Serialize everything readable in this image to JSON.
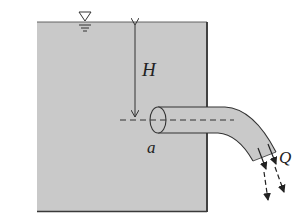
{
  "figure": {
    "labels": {
      "head": "H",
      "pipe_area": "a",
      "discharge": "Q"
    },
    "symbols": {
      "free_surface": "free-surface-triangle"
    },
    "colors": {
      "water": "#c9c9c9",
      "outline": "#3a3a3a",
      "background": "#ffffff"
    }
  }
}
